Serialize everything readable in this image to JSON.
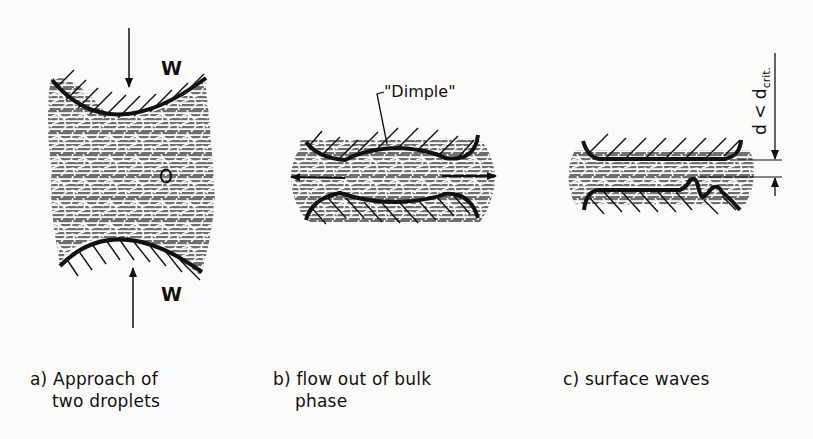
{
  "figure": {
    "type": "schematic of droplet coalescence stages",
    "panels": [
      {
        "id": "a",
        "caption_prefix": "a)",
        "caption_line1": "Approach of",
        "caption_line2": "two droplets",
        "force_label_top": "W",
        "force_label_bottom": "W"
      },
      {
        "id": "b",
        "caption_prefix": "b)",
        "caption_line1": "flow out of bulk",
        "caption_line2": "phase",
        "annotation": "\"Dimple\""
      },
      {
        "id": "c",
        "caption_prefix": "c)",
        "caption_line1": "surface waves",
        "dimension_label": "d < d",
        "dimension_subscript": "crit."
      }
    ],
    "colors": {
      "ink": "#111111",
      "film_fill": "#8a8a8a",
      "background": "#fbfbfa"
    }
  }
}
